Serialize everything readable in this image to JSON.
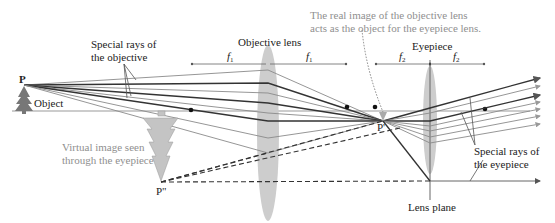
{
  "diagram": {
    "type": "compound-microscope-ray-diagram",
    "labels": {
      "point_p": "P",
      "point_p_prime": "P'",
      "point_p_double_prime": "P\"",
      "object": "Object",
      "special_rays_objective": [
        "Special rays of",
        "the objective"
      ],
      "objective_lens": "Objective lens",
      "eyepiece": "Eyepiece",
      "real_image_note": [
        "The real image of the objective lens",
        "acts as the object for the eyepiece lens."
      ],
      "virtual_image": [
        "Virtual image seen",
        "through the eyepiece"
      ],
      "special_rays_eyepiece": [
        "Special rays of",
        "the eyepiece"
      ],
      "lens_plane": "Lens plane",
      "f1": "f",
      "f1_sub": "1",
      "f2": "f",
      "f2_sub": "2"
    },
    "colors": {
      "lens_fill": "#c8c8c8",
      "ray_dark": "#333333",
      "ray_light": "#8a8a8a",
      "annotation_gray": "#8f8f8f",
      "virtual_tree": "#c4c4c4"
    }
  }
}
